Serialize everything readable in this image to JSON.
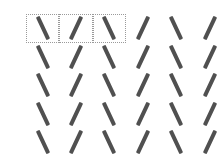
{
  "puzzle": {
    "columns": 6,
    "rows": 5,
    "stroke_color": "#505050",
    "selection_border_color": "#9a9a9a",
    "cells": [
      [
        "\\",
        "/",
        "\\",
        "/",
        "\\",
        "/"
      ],
      [
        "\\",
        "/",
        "\\",
        "/",
        "\\",
        "/"
      ],
      [
        "\\",
        "/",
        "\\",
        "/",
        "\\",
        "/"
      ],
      [
        "\\",
        "/",
        "\\",
        "/",
        "\\",
        "/"
      ],
      [
        "\\",
        "/",
        "\\",
        "/",
        "\\",
        "/"
      ]
    ],
    "selected_cells": [
      [
        0,
        0
      ],
      [
        0,
        1
      ],
      [
        0,
        2
      ]
    ]
  }
}
